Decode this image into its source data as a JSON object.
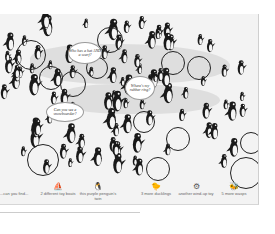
{
  "page": {
    "background": "#f3f3f3",
    "ice_color": "#dedede",
    "ink_color": "#1a1a1a"
  },
  "speech_bubbles": [
    {
      "text": "Who has a hat AND a scarf?",
      "x": 68,
      "y": 28,
      "w": 32,
      "h": 20
    },
    {
      "text": "Where's my rubber ring?",
      "x": 125,
      "y": 62,
      "w": 28,
      "h": 22
    },
    {
      "text": "Can you see a snowboarder?",
      "x": 46,
      "y": 88,
      "w": 36,
      "h": 18
    }
  ],
  "found_circles": [
    {
      "x": 16,
      "y": 26,
      "d": 28
    },
    {
      "x": 97,
      "y": 13,
      "d": 24
    },
    {
      "x": 39,
      "y": 52,
      "d": 22
    },
    {
      "x": 60,
      "y": 57,
      "d": 24
    },
    {
      "x": 161,
      "y": 37,
      "d": 22
    },
    {
      "x": 86,
      "y": 43,
      "d": 20
    },
    {
      "x": 187,
      "y": 42,
      "d": 22
    },
    {
      "x": 27,
      "y": 130,
      "d": 30
    },
    {
      "x": 133,
      "y": 97,
      "d": 20
    },
    {
      "x": 166,
      "y": 113,
      "d": 22
    },
    {
      "x": 240,
      "y": 118,
      "d": 20
    },
    {
      "x": 230,
      "y": 143,
      "d": 30
    },
    {
      "x": 146,
      "y": 143,
      "d": 22
    }
  ],
  "captions": {
    "intro": "...can you find...",
    "items": [
      {
        "label": "2 different toy boats",
        "icon": "toy-boat-icon",
        "x": 38
      },
      {
        "label": "this purple penguin's twin",
        "icon": "purple-penguin-icon",
        "x": 78
      },
      {
        "label": "3 more ducklings",
        "icon": "duckling-icon",
        "x": 136
      },
      {
        "label": "another wind-up toy",
        "icon": "wind-up-toy-icon",
        "x": 176
      },
      {
        "label": "5 more wasps",
        "icon": "wasp-icon",
        "x": 214
      }
    ]
  }
}
